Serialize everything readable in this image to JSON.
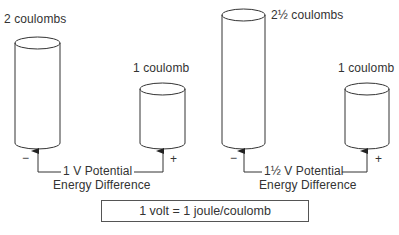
{
  "diagram": {
    "left_group": {
      "large_cylinder": {
        "label": "2 coulombs",
        "charge": 2
      },
      "small_cylinder": {
        "label": "1 coulomb",
        "charge": 1
      },
      "negative_sign": "−",
      "positive_sign": "+",
      "potential_label": "1 V Potential",
      "energy_label": "Energy Difference"
    },
    "right_group": {
      "large_cylinder": {
        "label": "2½ coulombs",
        "charge": 2.5
      },
      "small_cylinder": {
        "label": "1 coulomb",
        "charge": 1
      },
      "negative_sign": "−",
      "positive_sign": "+",
      "potential_label": "1½ V Potential",
      "energy_label": "Energy Difference"
    },
    "formula": "1 volt = 1 joule/coulomb",
    "colors": {
      "line": "#333333",
      "background": "#ffffff"
    }
  }
}
